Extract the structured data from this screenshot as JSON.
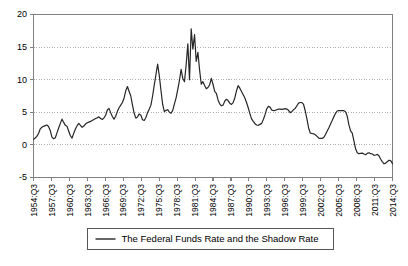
{
  "chart_data": {
    "type": "line",
    "title": "",
    "subtitle": "",
    "xlabel": "",
    "ylabel": "",
    "ylim": [
      -5,
      20
    ],
    "yticks": [
      -5,
      0,
      5,
      10,
      15,
      20
    ],
    "ytick_labels": [
      "-5",
      "0",
      "5",
      "10",
      "15",
      "20"
    ],
    "grid": true,
    "grid_style": "dotted-horizontal",
    "legend_position": "below-axes-center",
    "line_color": "#262626",
    "axis_color": "#808080",
    "background_color": "#ffffff",
    "xtick_labels": [
      "1954:Q3",
      "1957:Q3",
      "1960:Q3",
      "1963:Q3",
      "1966:Q3",
      "1969:Q3",
      "1972:Q3",
      "1975:Q3",
      "1978:Q3",
      "1981:Q3",
      "1984:Q3",
      "1987:Q3",
      "1990:Q3",
      "1993:Q3",
      "1996:Q3",
      "1999:Q3",
      "2002:Q3",
      "2005:Q3",
      "2008:Q3",
      "2011:Q3",
      "2014:Q3"
    ],
    "series": [
      {
        "name": "The Federal Funds Rate and the Shadow Rate",
        "x_start": "1954:Q3",
        "x_end": "2014:Q3",
        "x_step_quarters": 1,
        "values": [
          0.85,
          1.05,
          1.3,
          1.75,
          2.45,
          2.7,
          2.85,
          2.95,
          3.05,
          2.8,
          2.2,
          1.2,
          0.95,
          1.1,
          1.85,
          2.6,
          3.3,
          3.95,
          3.45,
          3.0,
          2.85,
          2.1,
          1.4,
          1.05,
          1.8,
          2.45,
          2.95,
          3.3,
          3.0,
          2.7,
          2.9,
          3.2,
          3.4,
          3.5,
          3.6,
          3.75,
          3.9,
          4.05,
          4.15,
          4.3,
          4.05,
          3.9,
          4.15,
          4.55,
          5.35,
          5.6,
          4.95,
          4.35,
          3.95,
          4.4,
          5.15,
          5.7,
          6.1,
          6.5,
          7.2,
          8.3,
          8.95,
          8.2,
          7.5,
          6.1,
          4.85,
          4.1,
          4.3,
          4.75,
          4.55,
          3.85,
          3.75,
          4.2,
          4.95,
          5.5,
          6.1,
          7.5,
          9.2,
          10.8,
          12.4,
          10.6,
          8.3,
          6.2,
          5.1,
          5.3,
          5.4,
          5.0,
          4.85,
          5.3,
          6.3,
          7.2,
          8.5,
          9.9,
          11.6,
          10.2,
          9.7,
          12.3,
          15.5,
          10.0,
          17.8,
          14.7,
          16.9,
          12.8,
          14.2,
          11.5,
          9.3,
          9.7,
          9.1,
          8.6,
          8.8,
          9.2,
          10.2,
          9.3,
          8.2,
          7.9,
          6.9,
          6.3,
          6.0,
          6.1,
          6.7,
          7.0,
          6.8,
          6.4,
          6.2,
          6.5,
          7.2,
          8.3,
          9.1,
          8.7,
          8.2,
          7.7,
          7.2,
          6.5,
          5.7,
          4.8,
          4.0,
          3.6,
          3.25,
          3.05,
          3.0,
          3.15,
          3.3,
          3.9,
          4.6,
          5.5,
          5.9,
          5.8,
          5.35,
          5.25,
          5.3,
          5.4,
          5.5,
          5.5,
          5.45,
          5.5,
          5.55,
          5.5,
          5.3,
          4.95,
          5.1,
          5.4,
          5.6,
          6.0,
          6.4,
          6.5,
          6.5,
          6.2,
          5.2,
          3.95,
          2.6,
          1.8,
          1.75,
          1.7,
          1.55,
          1.3,
          1.05,
          1.0,
          1.0,
          1.15,
          1.55,
          2.1,
          2.6,
          3.15,
          3.7,
          4.3,
          4.8,
          5.2,
          5.25,
          5.25,
          5.25,
          5.25,
          5.1,
          4.4,
          3.1,
          2.15,
          1.8,
          0.6,
          -0.6,
          -1.2,
          -1.35,
          -1.3,
          -1.25,
          -1.4,
          -1.5,
          -1.3,
          -1.2,
          -1.35,
          -1.4,
          -1.6,
          -1.55,
          -1.45,
          -1.7,
          -2.2,
          -2.6,
          -2.9,
          -2.8,
          -2.55,
          -2.35,
          -2.45,
          -2.9
        ]
      }
    ]
  },
  "legend": {
    "entries": [
      {
        "label": "The Federal Funds Rate and the Shadow Rate",
        "marker": "line-swatch"
      }
    ]
  }
}
